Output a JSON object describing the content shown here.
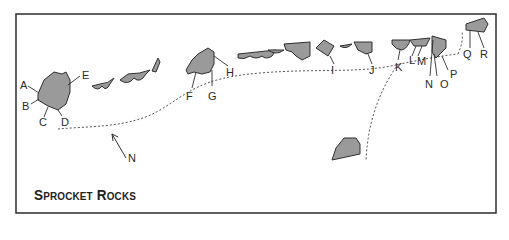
{
  "title": "Sprocket Rocks",
  "north_label": "N",
  "colors": {
    "rock_fill": "#9a9a9a",
    "outline": "#2e2e2e",
    "frame": "#3a3a3a",
    "background": "#ffffff"
  },
  "route_labels": {
    "A": "A",
    "B": "B",
    "C": "C",
    "D": "D",
    "E": "E",
    "F": "F",
    "G": "G",
    "H": "H",
    "I": "I",
    "J": "J",
    "K": "K",
    "L": "L",
    "M": "M",
    "N": "N",
    "O": "O",
    "P": "P",
    "Q": "Q",
    "R": "R"
  }
}
